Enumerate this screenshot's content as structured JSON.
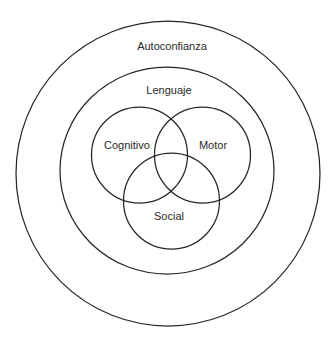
{
  "diagram": {
    "type": "nested-venn",
    "stroke_color": "#262626",
    "text_color": "#2a2a2a",
    "background": "#ffffff",
    "outer_ring": {
      "label": "Autoconfianza",
      "cx": 168,
      "cy": 173.5,
      "rx": 152,
      "ry": 152.5,
      "label_x": 172,
      "label_y": 46
    },
    "middle_ring": {
      "label": "Lenguaje",
      "cx": 167,
      "cy": 170.5,
      "rx": 107,
      "ry": 103.5,
      "label_x": 169,
      "label_y": 90
    },
    "venn": [
      {
        "label": "Cognitivo",
        "cx": 139.5,
        "cy": 155,
        "r": 48,
        "label_x": 127,
        "label_y": 145
      },
      {
        "label": "Motor",
        "cx": 202.5,
        "cy": 155,
        "r": 48,
        "label_x": 213,
        "label_y": 145
      },
      {
        "label": "Social",
        "cx": 171.5,
        "cy": 201,
        "r": 48,
        "label_x": 169,
        "label_y": 216
      }
    ]
  }
}
